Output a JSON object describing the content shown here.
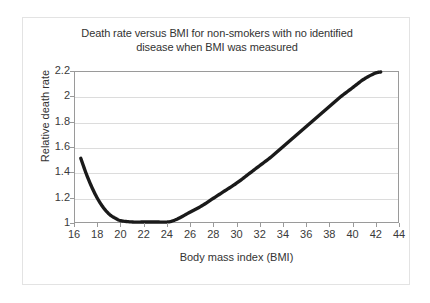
{
  "chart_data": {
    "type": "line",
    "title": "Death rate versus BMI for non-smokers with no identified disease when BMI was measured",
    "title_line1": "Death rate versus BMI for non-smokers with no identified",
    "title_line2": "disease when BMI was measured",
    "xlabel": "Body mass index (BMI)",
    "ylabel": "Relative death rate",
    "xlim": [
      16,
      44
    ],
    "ylim": [
      1,
      2.2
    ],
    "grid": true,
    "legend": "none",
    "line_color": "#1a1a1a",
    "grid_color": "#dcdcdc",
    "axis_color": "#9a9a9a",
    "xticks": [
      16,
      18,
      20,
      22,
      24,
      26,
      28,
      30,
      32,
      34,
      36,
      38,
      40,
      42,
      44
    ],
    "xtick_labels": [
      "16",
      "18",
      "20",
      "22",
      "24",
      "26",
      "28",
      "30",
      "32",
      "34",
      "36",
      "38",
      "40",
      "42",
      "44"
    ],
    "yticks": [
      1,
      1.2,
      1.4,
      1.6,
      1.8,
      2,
      2.2
    ],
    "ytick_labels": [
      "1",
      "1.2",
      "1.4",
      "1.6",
      "1.8",
      "2",
      "2.2"
    ],
    "series": [
      {
        "name": "Relative death rate",
        "x": [
          16.5,
          17,
          17.5,
          18,
          18.5,
          19,
          19.5,
          20,
          21,
          22,
          23,
          24,
          24.5,
          25,
          26,
          27,
          28,
          29,
          30,
          31,
          32,
          33,
          34,
          35,
          36,
          37,
          38,
          39,
          40,
          41,
          42,
          42.5
        ],
        "y": [
          1.51,
          1.38,
          1.27,
          1.18,
          1.11,
          1.06,
          1.03,
          1.01,
          1.0,
          1.0,
          1.0,
          1.0,
          1.01,
          1.03,
          1.08,
          1.13,
          1.19,
          1.25,
          1.31,
          1.38,
          1.45,
          1.52,
          1.6,
          1.68,
          1.76,
          1.84,
          1.92,
          2.0,
          2.07,
          2.14,
          2.19,
          2.2
        ]
      }
    ]
  }
}
